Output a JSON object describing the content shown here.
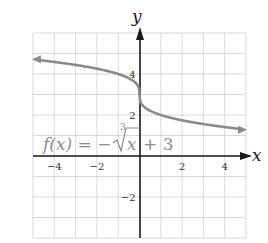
{
  "chart_data": {
    "type": "line",
    "title": "",
    "xlabel": "x",
    "ylabel": "y",
    "xlim": [
      -5,
      5
    ],
    "ylim": [
      -4,
      6
    ],
    "grid": true,
    "x_ticks": [
      -4,
      -2,
      2,
      4
    ],
    "y_ticks": [
      4,
      2,
      -2
    ],
    "x_tick_labels": [
      "−4",
      "−2",
      "2",
      "4"
    ],
    "y_tick_labels": [
      "4",
      "2",
      "−2"
    ],
    "series": [
      {
        "name": "f(x) = −∛x + 3",
        "function": "-cbrt(x) + 3",
        "color": "#8a8a8a",
        "arrows": "both",
        "x": [
          -5,
          -4,
          -3,
          -2,
          -1,
          -0.5,
          -0.1,
          0,
          0.1,
          0.5,
          1,
          2,
          3,
          4,
          5
        ],
        "y": [
          4.71,
          4.59,
          4.44,
          4.26,
          4.0,
          3.79,
          3.46,
          3.0,
          2.54,
          2.21,
          2.0,
          1.74,
          1.56,
          1.41,
          1.29
        ]
      }
    ],
    "annotations": [
      {
        "text": "f(x) = −∛x + 3",
        "x": -4.5,
        "y": 0.5
      }
    ]
  },
  "labels": {
    "x_axis": "x",
    "y_axis": "y",
    "function": {
      "prefix": "f(x) = −",
      "root_index": "3",
      "radicand": "x",
      "suffix": "+ 3"
    }
  },
  "colors": {
    "curve": "#8a8a8a",
    "axis": "#1a1a1a",
    "grid": "#cfcfcf",
    "label": "#8c8c8c"
  }
}
